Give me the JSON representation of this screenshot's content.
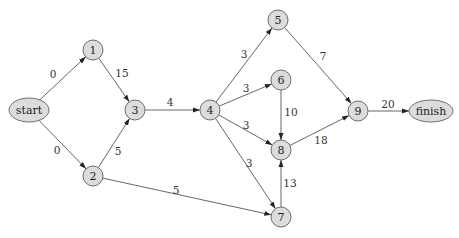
{
  "diagram": {
    "type": "directed-graph",
    "colors": {
      "node_fill": "#dcdcdc",
      "node_stroke": "#6e6e6e",
      "edge": "#555555",
      "text": "#222222"
    },
    "nodes": [
      {
        "id": "start",
        "label": "start",
        "shape": "ellipse",
        "x": 29,
        "y": 110,
        "rx": 20,
        "ry": 12
      },
      {
        "id": "1",
        "label": "1",
        "shape": "circle",
        "x": 93,
        "y": 50,
        "r": 10
      },
      {
        "id": "2",
        "label": "2",
        "shape": "circle",
        "x": 93,
        "y": 176,
        "r": 10
      },
      {
        "id": "3",
        "label": "3",
        "shape": "circle",
        "x": 135,
        "y": 110,
        "r": 10
      },
      {
        "id": "4",
        "label": "4",
        "shape": "circle",
        "x": 210,
        "y": 110,
        "r": 10
      },
      {
        "id": "5",
        "label": "5",
        "shape": "circle",
        "x": 278,
        "y": 20,
        "r": 10
      },
      {
        "id": "6",
        "label": "6",
        "shape": "circle",
        "x": 281,
        "y": 80,
        "r": 10
      },
      {
        "id": "8",
        "label": "8",
        "shape": "circle",
        "x": 281,
        "y": 150,
        "r": 10
      },
      {
        "id": "7",
        "label": "7",
        "shape": "circle",
        "x": 281,
        "y": 217,
        "r": 10
      },
      {
        "id": "9",
        "label": "9",
        "shape": "circle",
        "x": 358,
        "y": 111,
        "r": 10
      },
      {
        "id": "finish",
        "label": "finish",
        "shape": "ellipse",
        "x": 431,
        "y": 111,
        "rx": 22,
        "ry": 11
      }
    ],
    "edges": [
      {
        "from": "start",
        "to": "1",
        "weight": "0",
        "lx": 53,
        "ly": 74
      },
      {
        "from": "start",
        "to": "2",
        "weight": "0",
        "lx": 57,
        "ly": 150
      },
      {
        "from": "1",
        "to": "3",
        "weight": "15",
        "lx": 122,
        "ly": 73
      },
      {
        "from": "2",
        "to": "3",
        "weight": "5",
        "lx": 118,
        "ly": 151
      },
      {
        "from": "3",
        "to": "4",
        "weight": "4",
        "lx": 170,
        "ly": 102
      },
      {
        "from": "2",
        "to": "7",
        "weight": "5",
        "lx": 176,
        "ly": 190
      },
      {
        "from": "4",
        "to": "5",
        "weight": "3",
        "lx": 244,
        "ly": 54
      },
      {
        "from": "4",
        "to": "6",
        "weight": "3",
        "lx": 246,
        "ly": 88
      },
      {
        "from": "4",
        "to": "8",
        "weight": "3",
        "lx": 246,
        "ly": 125
      },
      {
        "from": "4",
        "to": "7",
        "weight": "3",
        "lx": 249,
        "ly": 163
      },
      {
        "from": "5",
        "to": "9",
        "weight": "7",
        "lx": 323,
        "ly": 56
      },
      {
        "from": "6",
        "to": "8",
        "weight": "10",
        "lx": 291,
        "ly": 112
      },
      {
        "from": "7",
        "to": "8",
        "weight": "13",
        "lx": 290,
        "ly": 183
      },
      {
        "from": "8",
        "to": "9",
        "weight": "18",
        "lx": 321,
        "ly": 140
      },
      {
        "from": "9",
        "to": "finish",
        "weight": "20",
        "lx": 388,
        "ly": 104
      }
    ]
  }
}
